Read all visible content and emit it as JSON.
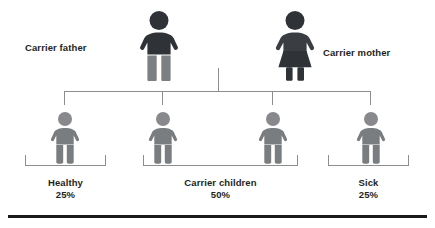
{
  "diagram": {
    "title_text": "",
    "colors": {
      "carrier_dark": "#2f3237",
      "carrier_dark_alt": "#3a3d42",
      "parent_legs_gray": "#7d8083",
      "child_gray": "#7a7d80",
      "child_head_gray": "#87898c",
      "line_gray": "#8d8d8d",
      "text_dark": "#231f20",
      "rule_black": "#1a1a1a",
      "background": "#ffffff"
    },
    "parents": [
      {
        "id": "father",
        "label": "Carrier father",
        "icon": "male-person-icon",
        "status": "carrier"
      },
      {
        "id": "mother",
        "label": "Carrier mother",
        "icon": "female-person-icon",
        "status": "carrier"
      }
    ],
    "children": [
      {
        "id": "child-1",
        "icon": "child-person-icon",
        "group": "healthy"
      },
      {
        "id": "child-2",
        "icon": "child-person-icon",
        "group": "carrier"
      },
      {
        "id": "child-3",
        "icon": "child-person-icon",
        "group": "carrier"
      },
      {
        "id": "child-4",
        "icon": "child-person-icon",
        "group": "sick"
      }
    ],
    "outcomes": [
      {
        "id": "healthy",
        "label": "Healthy",
        "percent": "25%"
      },
      {
        "id": "carrier-children",
        "label": "Carrier children",
        "percent": "50%"
      },
      {
        "id": "sick",
        "label": "Sick",
        "percent": "25%"
      }
    ]
  }
}
